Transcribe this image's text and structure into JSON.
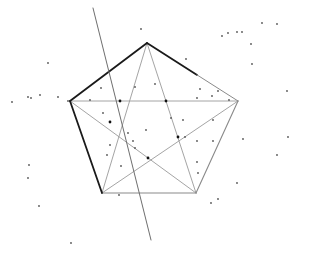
{
  "diagram": {
    "title": "",
    "colors": {
      "background": "#ffffff",
      "pentagon_bold": "#1a1a1a",
      "pentagon_light": "#8a8a8a",
      "star": "#9a9a9a",
      "cut_line": "#6e6e6e",
      "point": "#555555",
      "intersection_point": "#111111"
    },
    "vertices": {
      "top": [
        147,
        43
      ],
      "left": [
        70,
        101
      ],
      "right": [
        238,
        101
      ],
      "bottom_left": [
        102,
        193
      ],
      "bottom_right": [
        196,
        193
      ]
    },
    "pentagon_edges": [
      {
        "from": "left",
        "to": "top",
        "style": "bold"
      },
      {
        "from": "top",
        "to": "right",
        "style": "bold-fading"
      },
      {
        "from": "right",
        "to": "bottom_right",
        "style": "light"
      },
      {
        "from": "bottom_right",
        "to": "bottom_left",
        "style": "light"
      },
      {
        "from": "bottom_left",
        "to": "left",
        "style": "bold"
      }
    ],
    "star_edges": [
      {
        "from": "top",
        "to": "bottom_left"
      },
      {
        "from": "top",
        "to": "bottom_right"
      },
      {
        "from": "left",
        "to": "right"
      },
      {
        "from": "left",
        "to": "bottom_right"
      },
      {
        "from": "right",
        "to": "bottom_left"
      }
    ],
    "cut_line": {
      "from": [
        93,
        8
      ],
      "to": [
        151,
        240
      ]
    },
    "intersection_points": [
      [
        120,
        101
      ],
      [
        166,
        101
      ],
      [
        178,
        137
      ],
      [
        148,
        158
      ],
      [
        110,
        122
      ]
    ],
    "points": [
      [
        48,
        63
      ],
      [
        141,
        29
      ],
      [
        28,
        97
      ],
      [
        31,
        98
      ],
      [
        40,
        95
      ],
      [
        12,
        102
      ],
      [
        58,
        97
      ],
      [
        68,
        101
      ],
      [
        90,
        100
      ],
      [
        101,
        88
      ],
      [
        103,
        113
      ],
      [
        135,
        87
      ],
      [
        155,
        84
      ],
      [
        110,
        145
      ],
      [
        128,
        133
      ],
      [
        135,
        148
      ],
      [
        107,
        155
      ],
      [
        121,
        166
      ],
      [
        133,
        141
      ],
      [
        197,
        98
      ],
      [
        212,
        96
      ],
      [
        218,
        91
      ],
      [
        200,
        89
      ],
      [
        229,
        100
      ],
      [
        186,
        59
      ],
      [
        222,
        36
      ],
      [
        228,
        33
      ],
      [
        242,
        32
      ],
      [
        251,
        44
      ],
      [
        262,
        23
      ],
      [
        277,
        24
      ],
      [
        237,
        32
      ],
      [
        252,
        64
      ],
      [
        287,
        91
      ],
      [
        243,
        139
      ],
      [
        213,
        141
      ],
      [
        288,
        137
      ],
      [
        277,
        155
      ],
      [
        237,
        183
      ],
      [
        218,
        199
      ],
      [
        211,
        203
      ],
      [
        197,
        162
      ],
      [
        198,
        173
      ],
      [
        197,
        141
      ],
      [
        171,
        118
      ],
      [
        183,
        120
      ],
      [
        213,
        120
      ],
      [
        185,
        137
      ],
      [
        29,
        165
      ],
      [
        28,
        178
      ],
      [
        39,
        206
      ],
      [
        71,
        243
      ],
      [
        119,
        195
      ],
      [
        146,
        130
      ]
    ]
  }
}
